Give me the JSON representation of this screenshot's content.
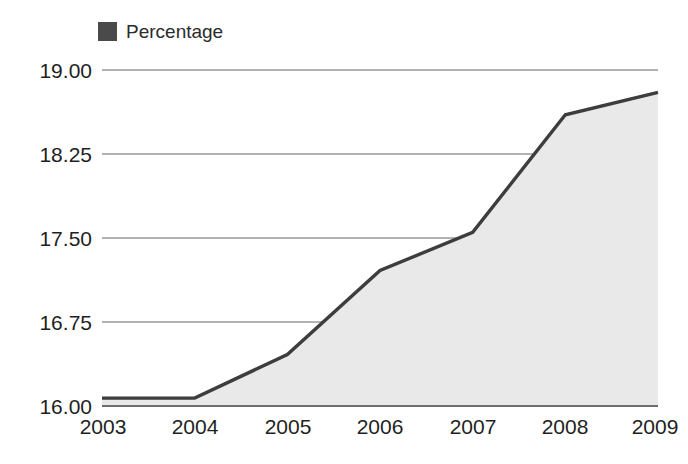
{
  "legend": {
    "items": [
      {
        "label": "Percentage",
        "color": "#4a4a4a",
        "swatch_icon": "square-swatch-icon"
      }
    ]
  },
  "axes": {
    "y_ticks": [
      "19.00",
      "18.25",
      "17.50",
      "16.75",
      "16.00"
    ],
    "x_ticks": [
      "2003",
      "2004",
      "2005",
      "2006",
      "2007",
      "2008",
      "2009"
    ]
  },
  "colors": {
    "line": "#3d3d3d",
    "fill": "#e9e9e9",
    "gridline": "#9a9a9a",
    "axis_line": "#6e6e6e",
    "text": "#1f1f1f",
    "background": "#ffffff"
  },
  "chart_data": {
    "type": "area",
    "title": "",
    "subtitle": "",
    "xlabel": "",
    "ylabel": "",
    "categories": [
      "2003",
      "2004",
      "2005",
      "2006",
      "2007",
      "2008",
      "2009"
    ],
    "series": [
      {
        "name": "Percentage",
        "color": "#3d3d3d",
        "values": [
          16.07,
          16.07,
          16.46,
          17.21,
          17.55,
          18.6,
          18.8
        ]
      }
    ],
    "ylim": [
      16.0,
      19.0
    ],
    "yticks": [
      16.0,
      16.75,
      17.5,
      18.25,
      19.0
    ],
    "ytick_labels": [
      "16.00",
      "16.75",
      "17.50",
      "18.25",
      "19.00"
    ],
    "xtick_labels": [
      "2003",
      "2004",
      "2005",
      "2006",
      "2007",
      "2008",
      "2009"
    ],
    "grid": true,
    "grid_axis": "y",
    "legend": true,
    "legend_position": "top-left",
    "filled": true,
    "annotations": []
  }
}
